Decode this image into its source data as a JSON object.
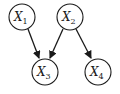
{
  "diagram": {
    "type": "directed-graph",
    "nodes": [
      {
        "id": "x1",
        "label": "X",
        "sub": "1",
        "cx": 22,
        "cy": 17,
        "r": 13
      },
      {
        "id": "x2",
        "label": "X",
        "sub": "2",
        "cx": 70,
        "cy": 17,
        "r": 13
      },
      {
        "id": "x3",
        "label": "X",
        "sub": "3",
        "cx": 45,
        "cy": 72,
        "r": 13
      },
      {
        "id": "x4",
        "label": "X",
        "sub": "4",
        "cx": 98,
        "cy": 72,
        "r": 13
      }
    ],
    "edges": [
      {
        "from": "x1",
        "to": "x3"
      },
      {
        "from": "x2",
        "to": "x3"
      },
      {
        "from": "x2",
        "to": "x4"
      }
    ],
    "colors": {
      "stroke": "#1a1a1a",
      "background": "#ffffff"
    }
  }
}
